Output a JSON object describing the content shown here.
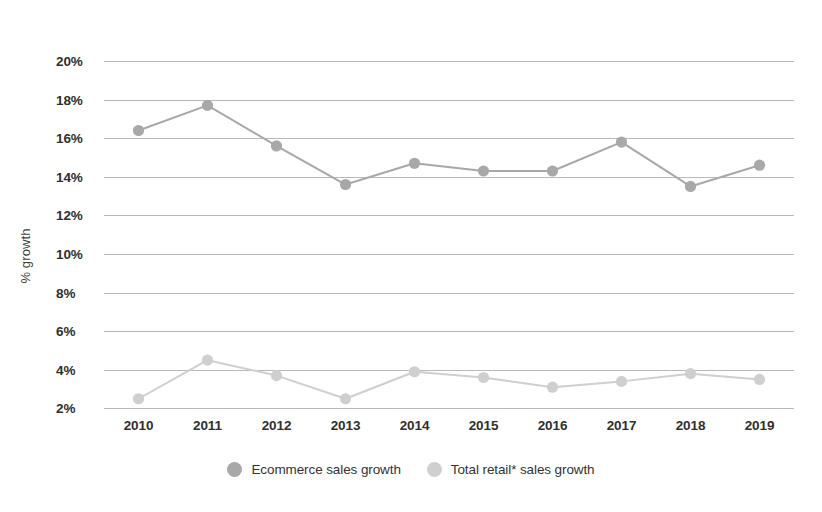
{
  "chart_data": {
    "type": "line",
    "title": "",
    "xlabel": "",
    "ylabel": "% growth",
    "categories": [
      "2010",
      "2011",
      "2012",
      "2013",
      "2014",
      "2015",
      "2016",
      "2017",
      "2018",
      "2019"
    ],
    "ylim": [
      2,
      20
    ],
    "ytick_labels": [
      "20%",
      "18%",
      "16%",
      "14%",
      "12%",
      "10%",
      "8%",
      "6%",
      "4%",
      "2%"
    ],
    "ytick_values": [
      20,
      18,
      16,
      14,
      12,
      10,
      8,
      6,
      4,
      2
    ],
    "grid": true,
    "legend_position": "bottom",
    "series": [
      {
        "name": "Ecommerce sales growth",
        "color": "#a8a8a8",
        "values": [
          16.4,
          17.7,
          15.6,
          13.6,
          14.7,
          14.3,
          14.3,
          15.8,
          13.5,
          14.6
        ]
      },
      {
        "name": "Total retail* sales growth",
        "color": "#cfcfcf",
        "values": [
          2.5,
          4.5,
          3.7,
          2.5,
          3.9,
          3.6,
          3.1,
          3.4,
          3.8,
          3.5
        ]
      }
    ]
  },
  "legend": {
    "items": [
      {
        "label": "Ecommerce sales growth",
        "color": "#a8a8a8"
      },
      {
        "label": "Total retail* sales growth",
        "color": "#cfcfcf"
      }
    ]
  },
  "axes": {
    "y_title": "% growth"
  },
  "colors": {
    "gridline": "#b9b9b9",
    "series_primary": "#a8a8a8",
    "series_secondary": "#cfcfcf",
    "text": "#2f2f2f",
    "background": "#ffffff"
  }
}
